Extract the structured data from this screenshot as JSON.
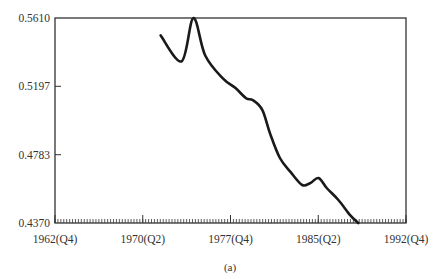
{
  "chart_data": {
    "type": "line",
    "title": "",
    "caption": "(a)",
    "xlabel": "",
    "ylabel": "",
    "x_ticks": [
      "1962(Q4)",
      "1970(Q2)",
      "1977(Q4)",
      "1985(Q2)",
      "1992(Q4)"
    ],
    "x_tick_values": [
      1962.875,
      1970.375,
      1977.875,
      1985.375,
      1992.875
    ],
    "y_ticks": [
      "0.5610",
      "0.5197",
      "0.4783",
      "0.4370"
    ],
    "y_tick_values": [
      0.561,
      0.5197,
      0.4783,
      0.437
    ],
    "xlim": [
      1962.875,
      1992.875
    ],
    "ylim": [
      0.437,
      0.561
    ],
    "grid": false,
    "legend": null,
    "minor_ticks": "quarterly ticks along x-axis",
    "series": [
      {
        "name": "series",
        "x": [
          1971.9,
          1973.7,
          1974.7,
          1975.7,
          1977.2,
          1978.3,
          1979.2,
          1979.8,
          1980.6,
          1981.3,
          1982.1,
          1983.0,
          1984.0,
          1984.7,
          1985.4,
          1986.1,
          1987.1,
          1988.1,
          1988.8
        ],
        "y": [
          0.5505,
          0.5348,
          0.561,
          0.5385,
          0.5246,
          0.5186,
          0.5125,
          0.5113,
          0.5053,
          0.4902,
          0.4763,
          0.4679,
          0.46,
          0.4612,
          0.4642,
          0.4582,
          0.4509,
          0.4418,
          0.437
        ]
      }
    ]
  },
  "labels": {
    "y_top": "0.5610",
    "y_2": "0.5197",
    "y_3": "0.4783",
    "y_bottom": "0.4370",
    "x_1": "1962(Q4)",
    "x_2": "1970(Q2)",
    "x_3": "1977(Q4)",
    "x_4": "1985(Q2)",
    "x_5": "1992(Q4)",
    "caption": "(a)"
  },
  "colors": {
    "line": "#1a1a1a",
    "axis": "#333333"
  }
}
